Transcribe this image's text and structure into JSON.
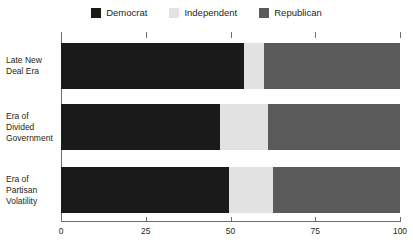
{
  "chart_data": {
    "type": "bar",
    "orientation": "horizontal",
    "stacked": true,
    "normalized": true,
    "title": "",
    "subtitle": "",
    "xlabel": "",
    "ylabel": "",
    "xlim": [
      0,
      100
    ],
    "xticks": [
      0,
      25,
      50,
      75,
      100
    ],
    "xtick_labels": [
      "0",
      "25",
      "50",
      "75",
      "100"
    ],
    "grid": false,
    "legend_position": "top-center",
    "categories": [
      "Late New Deal Era",
      "Era of Divided Government",
      "Era of Partisan Volatility"
    ],
    "category_label_lines": [
      [
        "Late New",
        "Deal Era"
      ],
      [
        "Era of",
        "Divided",
        "Government"
      ],
      [
        "Era of",
        "Partisan",
        "Volatility"
      ]
    ],
    "series": [
      {
        "name": "Democrat",
        "color": "#1a1a1a",
        "values": [
          54,
          47,
          49.5
        ]
      },
      {
        "name": "Independent",
        "color": "#e2e2e2",
        "values": [
          6,
          14,
          13
        ]
      },
      {
        "name": "Republican",
        "color": "#5a5a5a",
        "values": [
          40,
          39,
          37.5
        ]
      }
    ]
  },
  "legend": {
    "items": [
      {
        "label": "Democrat",
        "color": "#1a1a1a"
      },
      {
        "label": "Independent",
        "color": "#e2e2e2"
      },
      {
        "label": "Republican",
        "color": "#5a5a5a"
      }
    ]
  },
  "axis": {
    "line_color": "#6d6e71"
  }
}
